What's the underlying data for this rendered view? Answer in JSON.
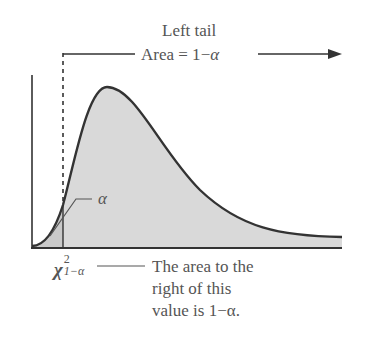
{
  "header": {
    "line1": "Left tail",
    "area_prefix": "Area = 1",
    "area_minus": "−",
    "area_alpha": "α"
  },
  "labels": {
    "alpha": "α",
    "chi_symbol": "χ",
    "chi_sup": "2",
    "chi_sub": "1−α"
  },
  "note": {
    "line1": "The area to the",
    "line2": "right of this",
    "line3": "value is 1−α."
  },
  "colors": {
    "curve": "#333333",
    "fill": "#d9d9d9",
    "left_tail_fill": "#c8c8c8",
    "text": "#555555"
  }
}
